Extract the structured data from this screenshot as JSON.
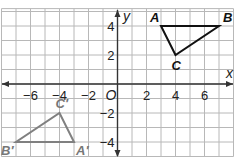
{
  "chart_data": {
    "type": "coordinate-plane",
    "title": "",
    "xlabel": "x",
    "ylabel": "y",
    "xlim": [
      -8,
      8
    ],
    "ylim": [
      -5,
      5.2
    ],
    "grid": true,
    "x_tick_labels": [
      {
        "value": -6,
        "label": "−6"
      },
      {
        "value": -4,
        "label": "−4"
      },
      {
        "value": -2,
        "label": "−2"
      },
      {
        "value": 2,
        "label": "2"
      },
      {
        "value": 4,
        "label": "4"
      },
      {
        "value": 6,
        "label": "6"
      }
    ],
    "y_tick_labels": [
      {
        "value": 4,
        "label": "4"
      },
      {
        "value": 2,
        "label": "2"
      },
      {
        "value": -2,
        "label": "−2"
      },
      {
        "value": -4,
        "label": "−4"
      }
    ],
    "origin_label": "O",
    "polygons": [
      {
        "name": "triangle ABC",
        "color": "#111111",
        "vertices": [
          {
            "label": "A",
            "x": 3,
            "y": 4
          },
          {
            "label": "B",
            "x": 7,
            "y": 4
          },
          {
            "label": "C",
            "x": 4,
            "y": 2
          }
        ]
      },
      {
        "name": "triangle A'B'C'",
        "color": "#808080",
        "vertices": [
          {
            "label": "A′",
            "x": -3,
            "y": -4
          },
          {
            "label": "B′",
            "x": -7,
            "y": -4
          },
          {
            "label": "C′",
            "x": -4,
            "y": -2
          }
        ]
      }
    ]
  },
  "colors": {
    "grid": "#b8b8b8",
    "axis": "#333333",
    "triangle_original": "#111111",
    "triangle_image": "#808080"
  }
}
